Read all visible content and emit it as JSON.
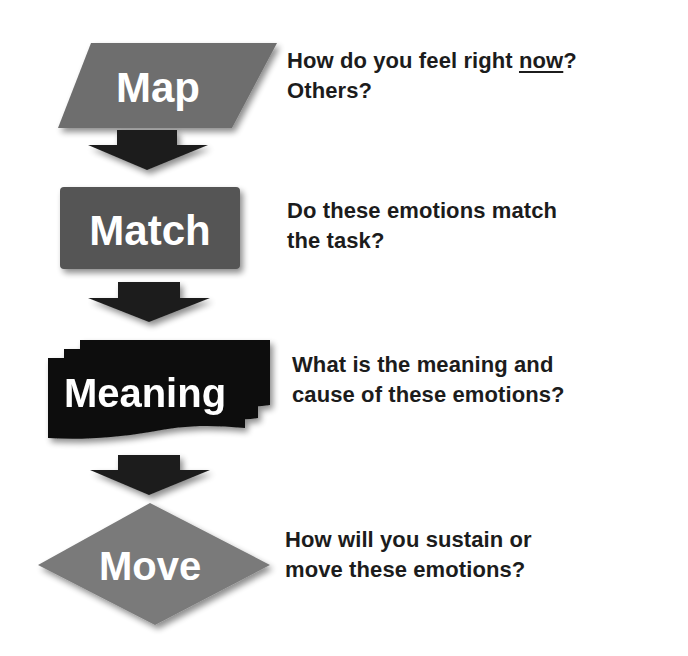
{
  "colors": {
    "map_fill": "#6e6e6e",
    "match_fill": "#545454",
    "meaning_fill": "#111111",
    "move_fill": "#7a7a7a",
    "arrow_fill": "#1e1e1e",
    "label_text": "#ffffff",
    "question_text": "#1c1c1c"
  },
  "steps": [
    {
      "id": "map",
      "label": "Map",
      "shape": "parallelogram",
      "question_parts": [
        "How do you feel right ",
        "now",
        "?"
      ],
      "question_line2": "Others?"
    },
    {
      "id": "match",
      "label": "Match",
      "shape": "rectangle",
      "question_line1": "Do these emotions match",
      "question_line2": "the task?"
    },
    {
      "id": "meaning",
      "label": "Meaning",
      "shape": "multi-document",
      "question_line1": "What is the meaning and",
      "question_line2": "cause of these emotions?"
    },
    {
      "id": "move",
      "label": "Move",
      "shape": "diamond",
      "question_line1": "How will you sustain or",
      "question_line2": "move these emotions?"
    }
  ],
  "arrows": [
    {
      "from": "map",
      "to": "match",
      "icon": "down-arrow-icon"
    },
    {
      "from": "match",
      "to": "meaning",
      "icon": "down-arrow-icon"
    },
    {
      "from": "meaning",
      "to": "move",
      "icon": "down-arrow-icon"
    }
  ]
}
